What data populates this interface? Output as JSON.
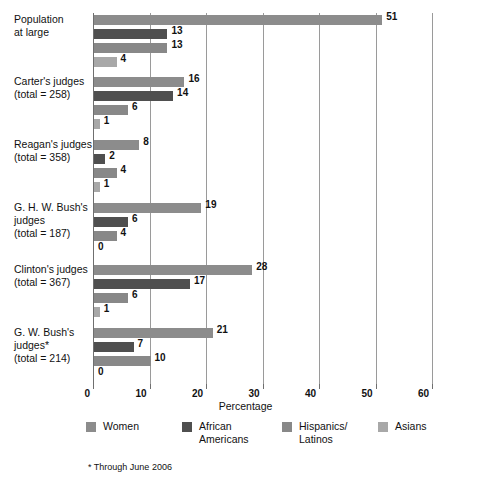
{
  "chart_data": {
    "type": "bar",
    "orientation": "horizontal",
    "title": "",
    "xlabel": "Percentage",
    "ylabel": "",
    "xlim": [
      0,
      60
    ],
    "xticks": [
      0,
      10,
      20,
      30,
      40,
      50,
      60
    ],
    "grid": true,
    "legend_position": "bottom",
    "categories": [
      "Population at large",
      "Carter's judges (total = 258)",
      "Reagan's judges (total = 358)",
      "G. H. W. Bush's judges (total = 187)",
      "Clinton's judges (total = 367)",
      "G. W. Bush's judges* (total = 214)"
    ],
    "series": [
      {
        "name": "Women",
        "color": "#8c8c8c",
        "values": [
          51,
          16,
          8,
          19,
          28,
          21
        ]
      },
      {
        "name": "African Americans",
        "color": "#4f4f4f",
        "values": [
          13,
          14,
          2,
          6,
          17,
          7
        ]
      },
      {
        "name": "Hispanics/ Latinos",
        "color": "#888888",
        "values": [
          13,
          6,
          4,
          4,
          6,
          10
        ]
      },
      {
        "name": "Asians",
        "color": "#a8a8a8",
        "values": [
          4,
          1,
          1,
          0,
          1,
          0
        ]
      }
    ],
    "footnote": "* Through June 2006"
  },
  "groups": [
    {
      "label_line1": "Population",
      "label_line2": "at large",
      "label_line3": "",
      "bars": [
        {
          "series": "Women",
          "value": 51,
          "value_text": "51"
        },
        {
          "series": "African Americans",
          "value": 13,
          "value_text": "13"
        },
        {
          "series": "Hispanics/ Latinos",
          "value": 13,
          "value_text": "13"
        },
        {
          "series": "Asians",
          "value": 4,
          "value_text": "4"
        }
      ]
    },
    {
      "label_line1": "Carter's judges",
      "label_line2": "(total = 258)",
      "label_line3": "",
      "bars": [
        {
          "series": "Women",
          "value": 16,
          "value_text": "16"
        },
        {
          "series": "African Americans",
          "value": 14,
          "value_text": "14"
        },
        {
          "series": "Hispanics/ Latinos",
          "value": 6,
          "value_text": "6"
        },
        {
          "series": "Asians",
          "value": 1,
          "value_text": "1"
        }
      ]
    },
    {
      "label_line1": "Reagan's judges",
      "label_line2": "(total = 358)",
      "label_line3": "",
      "bars": [
        {
          "series": "Women",
          "value": 8,
          "value_text": "8"
        },
        {
          "series": "African Americans",
          "value": 2,
          "value_text": "2"
        },
        {
          "series": "Hispanics/ Latinos",
          "value": 4,
          "value_text": "4"
        },
        {
          "series": "Asians",
          "value": 1,
          "value_text": "1"
        }
      ]
    },
    {
      "label_line1": "G. H. W. Bush's",
      "label_line2": "judges",
      "label_line3": "(total = 187)",
      "bars": [
        {
          "series": "Women",
          "value": 19,
          "value_text": "19"
        },
        {
          "series": "African Americans",
          "value": 6,
          "value_text": "6"
        },
        {
          "series": "Hispanics/ Latinos",
          "value": 4,
          "value_text": "4"
        },
        {
          "series": "Asians",
          "value": 0,
          "value_text": "0"
        }
      ]
    },
    {
      "label_line1": "Clinton's judges",
      "label_line2": "(total = 367)",
      "label_line3": "",
      "bars": [
        {
          "series": "Women",
          "value": 28,
          "value_text": "28"
        },
        {
          "series": "African Americans",
          "value": 17,
          "value_text": "17"
        },
        {
          "series": "Hispanics/ Latinos",
          "value": 6,
          "value_text": "6"
        },
        {
          "series": "Asians",
          "value": 1,
          "value_text": "1"
        }
      ]
    },
    {
      "label_line1": "G. W. Bush's",
      "label_line2": "judges*",
      "label_line3": "(total = 214)",
      "bars": [
        {
          "series": "Women",
          "value": 21,
          "value_text": "21"
        },
        {
          "series": "African Americans",
          "value": 7,
          "value_text": "7"
        },
        {
          "series": "Hispanics/ Latinos",
          "value": 10,
          "value_text": "10"
        },
        {
          "series": "Asians",
          "value": 0,
          "value_text": "0"
        }
      ]
    }
  ],
  "axis": {
    "tick_labels": [
      "0",
      "10",
      "20",
      "30",
      "40",
      "50",
      "60"
    ],
    "title": "Percentage"
  },
  "legend": {
    "items": [
      {
        "label": "Women",
        "color": "#8c8c8c"
      },
      {
        "label": "African\nAmericans",
        "color": "#4f4f4f"
      },
      {
        "label": "Hispanics/\nLatinos",
        "color": "#888888"
      },
      {
        "label": "Asians",
        "color": "#a8a8a8"
      }
    ]
  },
  "footnote": "* Through June 2006",
  "colors": {
    "women": "#8c8c8c",
    "african_americans": "#4f4f4f",
    "hispanics_latinos": "#888888",
    "asians": "#a8a8a8",
    "gridline": "#9a9a9a",
    "axis": "#6f6f6f",
    "text": "#111111"
  }
}
